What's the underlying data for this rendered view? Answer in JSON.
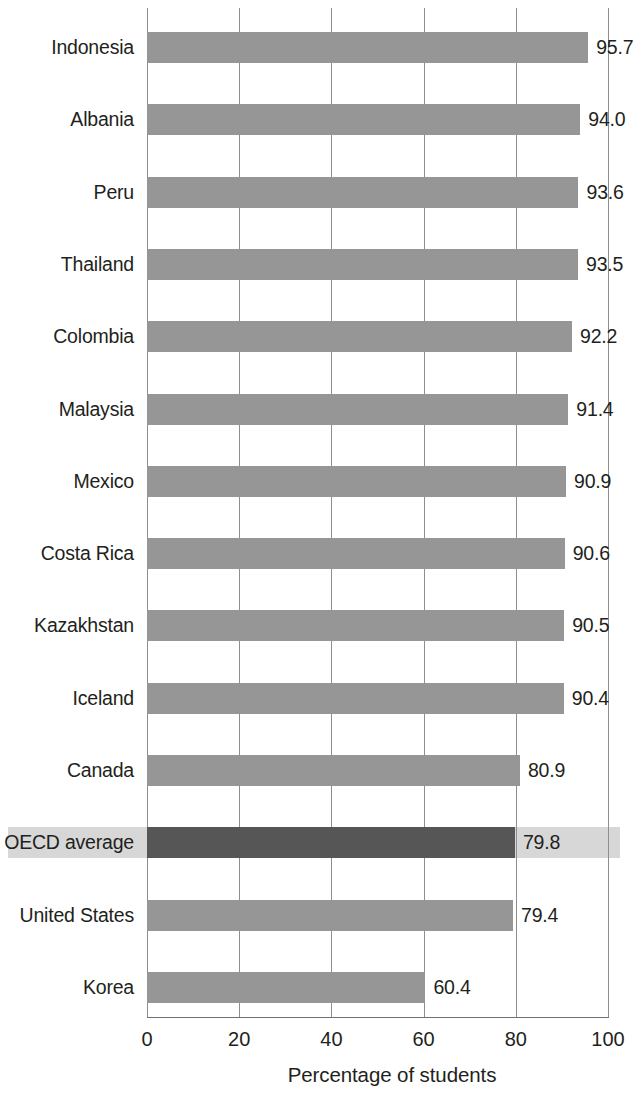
{
  "chart_data": {
    "type": "bar",
    "orientation": "horizontal",
    "title": "",
    "xlabel": "Percentage of students",
    "ylabel": "",
    "xlim": [
      0,
      100
    ],
    "xticks": [
      "0",
      "20",
      "40",
      "60",
      "80",
      "100"
    ],
    "xtick_values": [
      0,
      20,
      40,
      60,
      80,
      100
    ],
    "grid": "vertical",
    "legend": "none",
    "categories": [
      "Indonesia",
      "Albania",
      "Peru",
      "Thailand",
      "Colombia",
      "Malaysia",
      "Mexico",
      "Costa Rica",
      "Kazakhstan",
      "Iceland",
      "Canada",
      "OECD average",
      "United States",
      "Korea"
    ],
    "values": [
      95.7,
      94.0,
      93.6,
      93.5,
      92.2,
      91.4,
      90.9,
      90.6,
      90.5,
      90.4,
      80.9,
      79.8,
      79.4,
      60.4
    ],
    "value_labels": [
      "95.7",
      "94.0",
      "93.6",
      "93.5",
      "92.2",
      "91.4",
      "90.9",
      "90.6",
      "90.5",
      "90.4",
      "80.9",
      "79.8",
      "79.4",
      "60.4"
    ],
    "highlighted_category": "OECD average",
    "highlighted_index": 11,
    "bars": [
      {
        "label": "Indonesia",
        "value": 95.7,
        "value_label": "95.7",
        "highlighted": false
      },
      {
        "label": "Albania",
        "value": 94.0,
        "value_label": "94.0",
        "highlighted": false
      },
      {
        "label": "Peru",
        "value": 93.6,
        "value_label": "93.6",
        "highlighted": false
      },
      {
        "label": "Thailand",
        "value": 93.5,
        "value_label": "93.5",
        "highlighted": false
      },
      {
        "label": "Colombia",
        "value": 92.2,
        "value_label": "92.2",
        "highlighted": false
      },
      {
        "label": "Malaysia",
        "value": 91.4,
        "value_label": "91.4",
        "highlighted": false
      },
      {
        "label": "Mexico",
        "value": 90.9,
        "value_label": "90.9",
        "highlighted": false
      },
      {
        "label": "Costa Rica",
        "value": 90.6,
        "value_label": "90.6",
        "highlighted": false
      },
      {
        "label": "Kazakhstan",
        "value": 90.5,
        "value_label": "90.5",
        "highlighted": false
      },
      {
        "label": "Iceland",
        "value": 90.4,
        "value_label": "90.4",
        "highlighted": false
      },
      {
        "label": "Canada",
        "value": 80.9,
        "value_label": "80.9",
        "highlighted": false
      },
      {
        "label": "OECD average",
        "value": 79.8,
        "value_label": "79.8",
        "highlighted": true
      },
      {
        "label": "United States",
        "value": 79.4,
        "value_label": "79.4",
        "highlighted": false
      },
      {
        "label": "Korea",
        "value": 60.4,
        "value_label": "60.4",
        "highlighted": false
      }
    ],
    "colors": {
      "bar": "#969696",
      "bar_highlight": "#565656",
      "row_highlight_band": "#d7d7d7",
      "gridline": "#8e8e8e",
      "axis": "#6f6f6f",
      "text": "#231f20",
      "background": "#ffffff"
    }
  }
}
